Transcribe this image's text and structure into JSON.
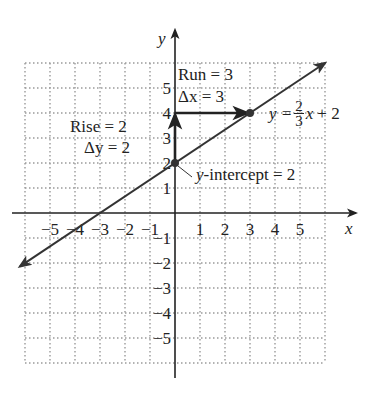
{
  "chart_data": {
    "type": "line",
    "title": "",
    "xlabel": "x",
    "ylabel": "y",
    "xlim": [
      -6,
      6
    ],
    "ylim": [
      -6,
      6
    ],
    "grid": true,
    "x_ticks": [
      "-5",
      "-4",
      "-3",
      "-2",
      "-1",
      "1",
      "2",
      "3",
      "4",
      "5"
    ],
    "y_ticks": [
      "5",
      "4",
      "3",
      "2",
      "1",
      "-1",
      "-2",
      "-3",
      "-4",
      "-5"
    ],
    "series": [
      {
        "name": "y = 2/3 x + 2",
        "slope": 0.6667,
        "intercept": 2,
        "x": [
          -6,
          -3,
          0,
          3,
          6
        ],
        "y": [
          -2,
          0,
          2,
          4,
          6
        ]
      }
    ],
    "points": [
      {
        "x": 0,
        "y": 2,
        "label": "y-intercept = 2"
      },
      {
        "x": 3,
        "y": 4
      }
    ],
    "annotations": [
      {
        "text": "Rise = 2",
        "sub": "Δy = 2",
        "from": [
          0,
          2
        ],
        "to": [
          0,
          4
        ],
        "kind": "vertical-arrow"
      },
      {
        "text": "Run = 3",
        "sub": "Δx = 3",
        "from": [
          0,
          4
        ],
        "to": [
          3,
          4
        ],
        "kind": "horizontal-arrow"
      }
    ]
  },
  "labels": {
    "axis_x": "x",
    "axis_y": "y",
    "rise": "Rise = 2",
    "delta_y": "Δy = 2",
    "run": "Run = 3",
    "delta_x": "Δx = 3",
    "equation_lhs": "y =",
    "equation_num": "2",
    "equation_den": "3",
    "equation_rhs_var": "x",
    "equation_rhs_rest": "+ 2",
    "intercept_var": "y",
    "intercept_rest": "-intercept = 2"
  },
  "colors": {
    "grid": "#9a9a9a",
    "axis": "#222222",
    "line": "#333333"
  }
}
